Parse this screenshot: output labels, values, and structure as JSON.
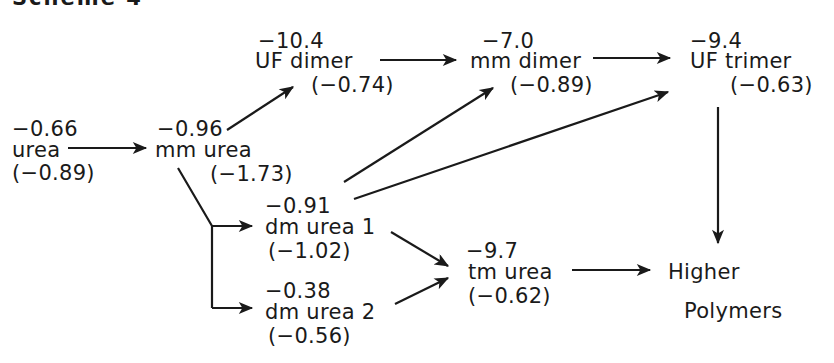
{
  "title": "Scheme 4",
  "nodes": {
    "urea": {
      "top": "−0.66",
      "name": "urea",
      "bottom": "(−0.89)"
    },
    "mm_urea": {
      "top": "−0.96",
      "name": "mm urea",
      "bottom": "(−1.73)"
    },
    "uf_dimer": {
      "top": "−10.4",
      "name": "UF dimer",
      "bottom": "(−0.74)"
    },
    "mm_dimer": {
      "top": "−7.0",
      "name": "mm dimer",
      "bottom": "(−0.89)"
    },
    "uf_trimer": {
      "top": "−9.4",
      "name": "UF trimer",
      "bottom": "(−0.63)"
    },
    "dm_urea_1": {
      "top": "−0.91",
      "name": "dm urea 1",
      "bottom": "(−1.02)"
    },
    "dm_urea_2": {
      "top": "−0.38",
      "name": "dm urea 2",
      "bottom": "(−0.56)"
    },
    "tm_urea": {
      "top": "−9.7",
      "name": "tm urea",
      "bottom": "(−0.62)"
    },
    "higher_polymers": {
      "line1": "Higher",
      "line2": "Polymers"
    }
  },
  "edges": [
    {
      "from": "urea",
      "to": "mm_urea"
    },
    {
      "from": "mm_urea",
      "to": "uf_dimer"
    },
    {
      "from": "mm_urea",
      "to": "dm_urea_1"
    },
    {
      "from": "mm_urea",
      "to": "dm_urea_2"
    },
    {
      "from": "uf_dimer",
      "to": "mm_dimer"
    },
    {
      "from": "mm_dimer",
      "to": "uf_trimer"
    },
    {
      "from": "dm_urea_1",
      "to": "mm_dimer"
    },
    {
      "from": "dm_urea_1",
      "to": "uf_trimer"
    },
    {
      "from": "dm_urea_1",
      "to": "tm_urea"
    },
    {
      "from": "dm_urea_2",
      "to": "tm_urea"
    },
    {
      "from": "tm_urea",
      "to": "higher_polymers"
    },
    {
      "from": "uf_trimer",
      "to": "higher_polymers"
    }
  ],
  "colors": {
    "ink": "#1a1a1a",
    "background": "#ffffff"
  }
}
